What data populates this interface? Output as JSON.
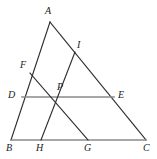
{
  "figure": {
    "type": "geometry-diagram",
    "width": 157,
    "height": 159,
    "colors": {
      "stroke_dark": "#2b2b2b",
      "stroke_gray": "#8a8a8a",
      "background": "#ffffff",
      "label": "#1a1a1a"
    },
    "points": [
      {
        "id": "A",
        "label": "A",
        "x": 50,
        "y": 22,
        "label_x": 45,
        "label_y": 6
      },
      {
        "id": "B",
        "label": "B",
        "x": 11,
        "y": 140,
        "label_x": 6,
        "label_y": 143
      },
      {
        "id": "C",
        "label": "C",
        "x": 146,
        "y": 140,
        "label_x": 143,
        "label_y": 143
      },
      {
        "id": "D",
        "label": "D",
        "x": 22,
        "y": 97,
        "label_x": 8,
        "label_y": 90
      },
      {
        "id": "E",
        "label": "E",
        "x": 114,
        "y": 97,
        "label_x": 118,
        "label_y": 90
      },
      {
        "id": "F",
        "label": "F",
        "x": 30,
        "y": 73,
        "label_x": 20,
        "label_y": 60
      },
      {
        "id": "G",
        "label": "G",
        "x": 88,
        "y": 140,
        "label_x": 84,
        "label_y": 143
      },
      {
        "id": "H",
        "label": "H",
        "x": 41,
        "y": 140,
        "label_x": 36,
        "label_y": 143
      },
      {
        "id": "I",
        "label": "I",
        "x": 75,
        "y": 52,
        "label_x": 77,
        "label_y": 40
      },
      {
        "id": "P",
        "label": "P",
        "x": 60,
        "y": 97,
        "label_x": 57,
        "label_y": 82
      }
    ],
    "segments": [
      {
        "id": "AB",
        "from": "A",
        "to": "B",
        "style": "dark"
      },
      {
        "id": "AC",
        "from": "A",
        "to": "C",
        "style": "dark"
      },
      {
        "id": "BC",
        "from": "B",
        "to": "C",
        "style": "gray"
      },
      {
        "id": "DE",
        "from": "D",
        "to": "E",
        "style": "gray"
      },
      {
        "id": "FG",
        "from": "F",
        "to": "G",
        "style": "dark"
      },
      {
        "id": "IH",
        "from": "I",
        "to": "H",
        "style": "dark"
      }
    ]
  }
}
